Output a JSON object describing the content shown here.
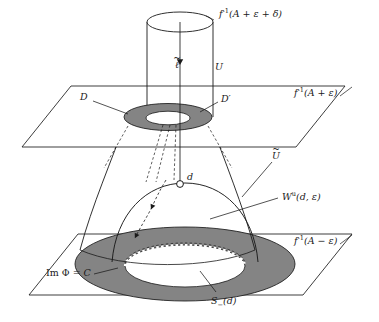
{
  "figure": {
    "background_color": "#ffffff",
    "line_color": "#1a1a1a",
    "annulus_fill": "#848484",
    "annulus_fill_light": "#9a9a9a",
    "inner_hole_fill": "#ffffff"
  },
  "labels": {
    "top_level_set": {
      "f": "f",
      "exp": "-1",
      "arg": "(A + ε + δ)"
    },
    "upper_level_set": {
      "f": "f",
      "exp": "-1",
      "arg": "(A + ε)"
    },
    "lower_level_set": {
      "f": "f",
      "exp": "-1",
      "arg": "(A − ε)"
    },
    "flow_line": "ℓ",
    "cylinder": "U",
    "funnel": "U",
    "disk_left": "D",
    "disk_right": "D′",
    "critical_point": "d",
    "unstable_manifold": {
      "w": "W",
      "exp": "u",
      "arg": "(d, ε)"
    },
    "image_phi": {
      "im": "Im",
      "phi": "Φ",
      "eq": "= C"
    },
    "sphere_minus": {
      "s": "S",
      "sub": "−",
      "arg": "(d)"
    }
  },
  "geometry": {
    "upper_plane": "parallelogram level set f^-1(A+eps)",
    "lower_plane": "parallelogram level set f^-1(A-eps)",
    "cylinder_top_open_ellipse": true,
    "upper_annulus_shaded": true,
    "lower_annulus_shaded": true,
    "lower_annulus_inner_edge_dashed": true,
    "dashed_flow_arrows_count": 2,
    "solid_flow_arrow_count": 1
  }
}
